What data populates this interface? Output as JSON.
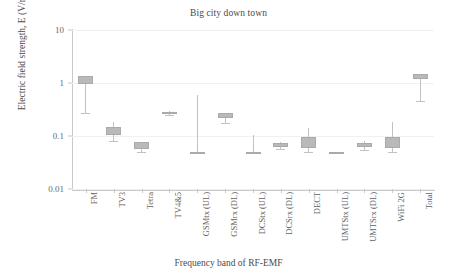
{
  "chart_data": {
    "type": "bar",
    "title": "Big city down town",
    "xlabel": "Frequency band of RF-EMF",
    "ylabel": "Electric field strength, E (V/m)",
    "yscale": "log",
    "ylim": [
      0.01,
      10
    ],
    "ytick_labels": [
      "10",
      "1",
      "0.1",
      "0.01"
    ],
    "ytick_values": [
      10,
      1,
      0.1,
      0.01
    ],
    "grid": false,
    "legend": "none",
    "categories": [
      "FM",
      "TV3",
      "Tetra",
      "TV4&5",
      "GSMtx (UL)",
      "GSMrx (DL)",
      "DCStx (UL)",
      "DCSrx (DL)",
      "DECT",
      "UMTStx (UL)",
      "UMTSrx (DL)",
      "WiFi 2G",
      "Total"
    ],
    "series": [
      {
        "name": "Electric field strength",
        "box_low": [
          0.96,
          0.105,
          0.058,
          0.265,
          0.05,
          0.215,
          0.05,
          0.062,
          0.059,
          0.05,
          0.062,
          0.059,
          1.2
        ],
        "box_high": [
          1.35,
          0.145,
          0.077,
          0.285,
          0.05,
          0.27,
          0.05,
          0.073,
          0.095,
          0.05,
          0.073,
          0.095,
          1.5
        ],
        "whisker_low": [
          0.275,
          0.082,
          0.05,
          0.25,
          0.05,
          0.175,
          0.05,
          0.058,
          0.05,
          0.05,
          0.055,
          0.05,
          0.455
        ],
        "whisker_high": [
          1.35,
          0.185,
          0.077,
          0.295,
          0.6,
          0.27,
          0.105,
          0.078,
          0.14,
          0.05,
          0.079,
          0.185,
          1.5
        ]
      }
    ],
    "values": [
      1.15,
      0.122,
      0.067,
      0.275,
      0.05,
      0.24,
      0.05,
      0.067,
      0.075,
      0.05,
      0.067,
      0.073,
      1.35
    ]
  },
  "colors": {
    "box_fill": "#b9b9b9",
    "box_stroke": "#aaaaaa",
    "whisker": "#c2c2c2",
    "axis": "#c9c9c9",
    "text": "#5a5a5a",
    "background": "#ffffff"
  }
}
